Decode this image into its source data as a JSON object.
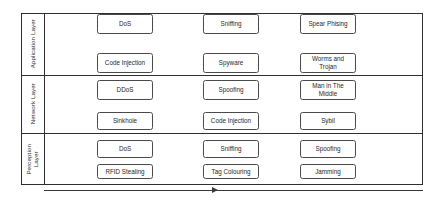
{
  "diagram": {
    "type": "layered-taxonomy",
    "layers": [
      {
        "id": "application",
        "label": "Application Layer",
        "rows": [
          {
            "cells": [
              "DoS",
              "Sniffing",
              "Spear Phising"
            ]
          },
          {
            "cells": [
              "Code Injection",
              "Spyware",
              "Worms and Trojan"
            ]
          }
        ]
      },
      {
        "id": "network",
        "label": "Network Layer",
        "rows": [
          {
            "cells": [
              "DDoS",
              "Spoofing",
              "Man in The Middle"
            ]
          },
          {
            "cells": [
              "Sinkhole",
              "Code Injection",
              "Sybil"
            ]
          }
        ]
      },
      {
        "id": "perception",
        "label": "Perception Layer",
        "rows": [
          {
            "cells": [
              "DoS",
              "Sniffing",
              "Spoofing"
            ]
          },
          {
            "cells": [
              "RFID Stealing",
              "Tag Colouring",
              "Jamming"
            ]
          }
        ]
      }
    ],
    "arrow": {
      "name": "progression-arrow",
      "direction": "right",
      "label": ""
    },
    "colors": {
      "frame_stroke": "#2f2f2f",
      "box_stroke": "#4a4a4a",
      "text": "#1f1f1f",
      "background": "#ffffff",
      "arrow": "#3a3a3a"
    }
  }
}
